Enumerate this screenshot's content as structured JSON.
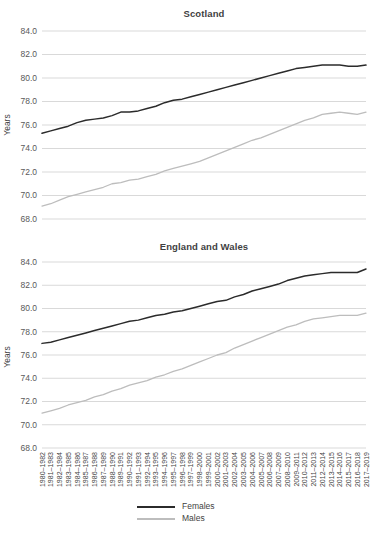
{
  "colors": {
    "females": "#2b2b2b",
    "males": "#bdbdbd",
    "gridline": "#d9d9d9",
    "tick_text": "#595959",
    "xtick_text": "#3f3f3f",
    "title_text": "#3f3f3f"
  },
  "legend": {
    "items": [
      {
        "label": "Females",
        "color_key": "females"
      },
      {
        "label": "Males",
        "color_key": "males"
      }
    ]
  },
  "chart_data": [
    {
      "type": "line",
      "title": "Scotland",
      "ylabel": "Years",
      "ylim": [
        68.0,
        84.0
      ],
      "yticks": [
        "84.0",
        "82.0",
        "80.0",
        "78.0",
        "76.0",
        "74.0",
        "72.0",
        "70.0",
        "68.0"
      ],
      "grid": true,
      "legend_position": "bottom",
      "categories": [
        "1980–1982",
        "1981–1983",
        "1982–1984",
        "1983–1985",
        "1984–1986",
        "1985–1987",
        "1986–1988",
        "1987–1989",
        "1988–1990",
        "1989–1991",
        "1990–1992",
        "1991–1993",
        "1992–1994",
        "1993–1995",
        "1994–1996",
        "1995–1997",
        "1996–1998",
        "1997–1999",
        "1998–2000",
        "1999–2001",
        "2000–2002",
        "2001–2003",
        "2002–2004",
        "2003–2005",
        "2004–2006",
        "2005–2007",
        "2006–2008",
        "2007–2009",
        "2008–2010",
        "2009–2011",
        "2010–2012",
        "2011–2013",
        "2012–2014",
        "2013–2015",
        "2014–2016",
        "2015–2017",
        "2016–2018",
        "2017–2019"
      ],
      "series": [
        {
          "name": "Females",
          "values": [
            75.3,
            75.5,
            75.7,
            75.9,
            76.2,
            76.4,
            76.5,
            76.6,
            76.8,
            77.1,
            77.1,
            77.2,
            77.4,
            77.6,
            77.9,
            78.1,
            78.2,
            78.4,
            78.6,
            78.8,
            79.0,
            79.2,
            79.4,
            79.6,
            79.8,
            80.0,
            80.2,
            80.4,
            80.6,
            80.8,
            80.9,
            81.0,
            81.1,
            81.1,
            81.1,
            81.0,
            81.0,
            81.1
          ]
        },
        {
          "name": "Males",
          "values": [
            69.1,
            69.3,
            69.6,
            69.9,
            70.1,
            70.3,
            70.5,
            70.7,
            71.0,
            71.1,
            71.3,
            71.4,
            71.6,
            71.8,
            72.1,
            72.3,
            72.5,
            72.7,
            72.9,
            73.2,
            73.5,
            73.8,
            74.1,
            74.4,
            74.7,
            74.9,
            75.2,
            75.5,
            75.8,
            76.1,
            76.4,
            76.6,
            76.9,
            77.0,
            77.1,
            77.0,
            76.9,
            77.1
          ]
        }
      ]
    },
    {
      "type": "line",
      "title": "England and Wales",
      "ylabel": "Years",
      "ylim": [
        68.0,
        84.0
      ],
      "yticks": [
        "84.0",
        "82.0",
        "80.0",
        "78.0",
        "76.0",
        "74.0",
        "72.0",
        "70.0",
        "68.0"
      ],
      "grid": true,
      "legend_position": "bottom",
      "categories": [
        "1980–1982",
        "1981–1983",
        "1982–1984",
        "1983–1985",
        "1984–1986",
        "1985–1987",
        "1986–1988",
        "1987–1989",
        "1988–1990",
        "1989–1991",
        "1990–1992",
        "1991–1993",
        "1992–1994",
        "1993–1995",
        "1994–1996",
        "1995–1997",
        "1996–1998",
        "1997–1999",
        "1998–2000",
        "1999–2001",
        "2000–2002",
        "2001–2003",
        "2002–2004",
        "2003–2005",
        "2004–2006",
        "2005–2007",
        "2006–2008",
        "2007–2009",
        "2008–2010",
        "2009–2011",
        "2010–2012",
        "2011–2013",
        "2012–2014",
        "2013–2015",
        "2014–2016",
        "2015–2017",
        "2016–2018",
        "2017–2019"
      ],
      "series": [
        {
          "name": "Females",
          "values": [
            77.0,
            77.1,
            77.3,
            77.5,
            77.7,
            77.9,
            78.1,
            78.3,
            78.5,
            78.7,
            78.9,
            79.0,
            79.2,
            79.4,
            79.5,
            79.7,
            79.8,
            80.0,
            80.2,
            80.4,
            80.6,
            80.7,
            81.0,
            81.2,
            81.5,
            81.7,
            81.9,
            82.1,
            82.4,
            82.6,
            82.8,
            82.9,
            83.0,
            83.1,
            83.1,
            83.1,
            83.1,
            83.4
          ]
        },
        {
          "name": "Males",
          "values": [
            71.0,
            71.2,
            71.4,
            71.7,
            71.9,
            72.1,
            72.4,
            72.6,
            72.9,
            73.1,
            73.4,
            73.6,
            73.8,
            74.1,
            74.3,
            74.6,
            74.8,
            75.1,
            75.4,
            75.7,
            76.0,
            76.2,
            76.6,
            76.9,
            77.2,
            77.5,
            77.8,
            78.1,
            78.4,
            78.6,
            78.9,
            79.1,
            79.2,
            79.3,
            79.4,
            79.4,
            79.4,
            79.6
          ]
        }
      ]
    }
  ]
}
